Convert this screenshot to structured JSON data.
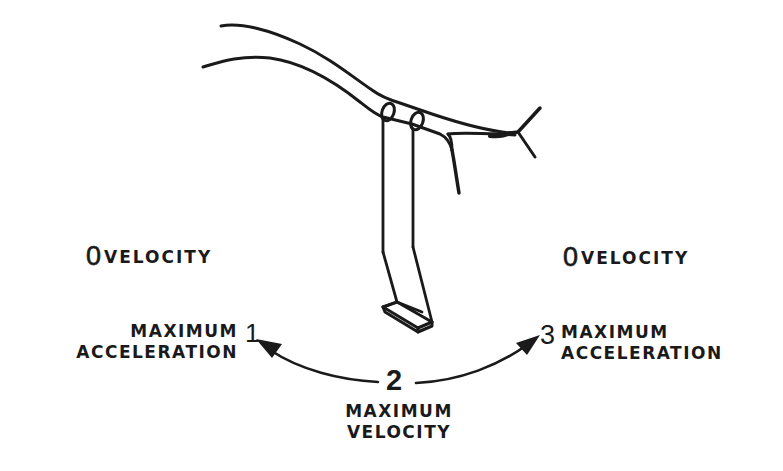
{
  "diagram": {
    "colors": {
      "ink": "#1a1a1a",
      "background": "#ffffff"
    },
    "labels": {
      "left_zero": {
        "digit": "0",
        "word": "VELOCITY"
      },
      "right_zero": {
        "digit": "0",
        "word": "VELOCITY"
      },
      "position_1": {
        "number": "1",
        "line1": "MAXIMUM",
        "line2": "ACCELERATION"
      },
      "position_2": {
        "number": "2",
        "line1": "MAXIMUM",
        "line2": "VELOCITY"
      },
      "position_3": {
        "number": "3",
        "line1": "MAXIMUM",
        "line2": "ACCELERATION"
      }
    },
    "arrows": [
      {
        "from": "position_2",
        "to": "position_1",
        "direction": "left"
      },
      {
        "from": "position_2",
        "to": "position_3",
        "direction": "right"
      }
    ]
  }
}
